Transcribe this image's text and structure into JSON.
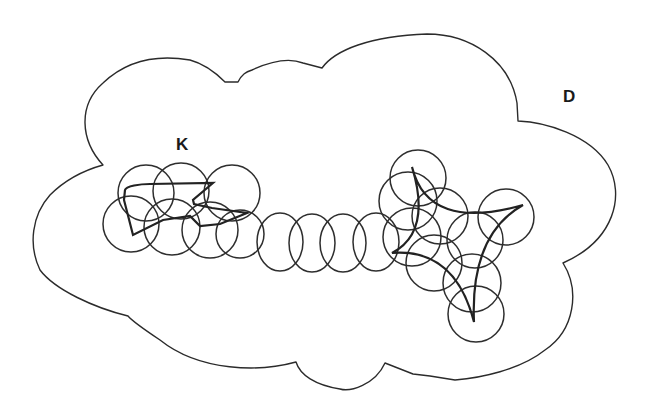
{
  "labels": {
    "region": {
      "text": "D",
      "x": 563,
      "y": 102
    },
    "compact_set": {
      "text": "K",
      "x": 176,
      "y": 150
    }
  },
  "colors": {
    "background": "#ffffff",
    "stroke": "#2b2b2b"
  },
  "region_D": {
    "description": "cloud-shaped open region D",
    "path": "M 103 165 C 80 140 78 105 103 83 C 125 62 155 54 190 60 C 205 64 215 72 225 82 L 238 82 C 242 74 246 72 252 70 C 265 64 285 56 303 63 L 322 68 C 335 50 370 36 427 34 C 470 34 510 60 517 103 L 518 121 C 545 122 590 135 608 165 C 625 195 615 240 563 263 C 580 290 575 330 545 350 C 520 370 480 378 455 380 L 430 376 L 413 374 L 385 363 C 375 385 350 392 340 389 C 315 385 300 375 296 362 C 260 372 200 372 160 340 C 145 330 133 322 128 316 C 95 308 55 290 40 270 C 28 245 32 215 50 195 C 65 180 85 170 103 165 Z"
  },
  "compact_set_K": {
    "description": "compact set K made of two shapes joined by a chain",
    "left_polygon": "M 125 190 C 126 186 140 184 150 184 L 213 183 L 193 200 L 194 204 L 212 208 L 247 213 L 220 224 L 200 226 L 190 216 L 163 220 L 133 235 L 124 200 Z",
    "star_curve": "M 412 167 Q 428 232 523 205 Q 470 235 474 322 Q 455 248 392 253 Q 432 232 412 167 Z"
  },
  "cover_circles": {
    "description": "finite cover of K by small discs",
    "left_cluster": [
      {
        "cx": 146,
        "cy": 193,
        "r": 28
      },
      {
        "cx": 181,
        "cy": 191,
        "r": 28
      },
      {
        "cx": 232,
        "cy": 193,
        "r": 28
      },
      {
        "cx": 131,
        "cy": 224,
        "r": 28
      },
      {
        "cx": 172,
        "cy": 227,
        "r": 28
      },
      {
        "cx": 210,
        "cy": 230,
        "r": 28
      },
      {
        "cx": 240,
        "cy": 234,
        "r": 24
      }
    ],
    "chain": [
      {
        "cx": 280,
        "cy": 242,
        "rx": 23,
        "ry": 29
      },
      {
        "cx": 312,
        "cy": 243,
        "rx": 23,
        "ry": 29
      },
      {
        "cx": 343,
        "cy": 243,
        "rx": 23,
        "ry": 29
      },
      {
        "cx": 376,
        "cy": 242,
        "rx": 23,
        "ry": 29
      }
    ],
    "right_cluster": [
      {
        "cx": 418,
        "cy": 178,
        "r": 28
      },
      {
        "cx": 408,
        "cy": 201,
        "r": 29
      },
      {
        "cx": 440,
        "cy": 216,
        "r": 28
      },
      {
        "cx": 412,
        "cy": 237,
        "r": 29
      },
      {
        "cx": 434,
        "cy": 263,
        "r": 28
      },
      {
        "cx": 506,
        "cy": 217,
        "r": 28
      },
      {
        "cx": 475,
        "cy": 240,
        "r": 28
      },
      {
        "cx": 472,
        "cy": 283,
        "r": 29
      },
      {
        "cx": 476,
        "cy": 314,
        "r": 28
      }
    ]
  }
}
